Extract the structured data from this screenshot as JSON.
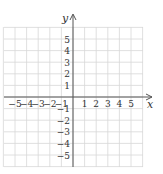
{
  "chart_data": {
    "type": "scatter",
    "title": "",
    "xlabel": "x",
    "ylabel": "y",
    "xlim": [
      -6,
      6
    ],
    "ylim": [
      -6,
      6
    ],
    "grid": true,
    "x_ticks": [
      "-5",
      "-4",
      "-3",
      "-2",
      "-1",
      "1",
      "2",
      "3",
      "4",
      "5"
    ],
    "y_ticks": [
      "5",
      "4",
      "3",
      "2",
      "1",
      "-1",
      "-2",
      "-3",
      "-4",
      "-5"
    ],
    "series": [],
    "points": []
  },
  "axes": {
    "x_label": "x",
    "y_label": "y"
  },
  "colors": {
    "grid": "#d8d8d8",
    "axis": "#555555",
    "text": "#333333"
  }
}
